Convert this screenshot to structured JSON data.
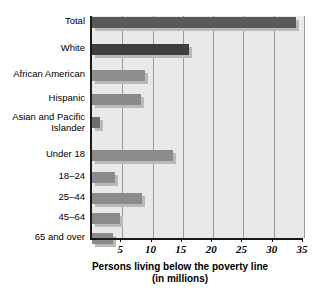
{
  "chart_data": {
    "type": "bar",
    "orientation": "horizontal",
    "title": "",
    "xlabel": "Persons living below the poverty line (in millions)",
    "xlabel_line1": "Persons living below the poverty line",
    "xlabel_line2": "(in millions)",
    "ylabel": "",
    "xlim": [
      0,
      35
    ],
    "ylim": null,
    "grid": true,
    "legend": "none",
    "xticks": [
      5,
      10,
      15,
      20,
      25,
      30,
      35
    ],
    "xtick_labels": [
      "5",
      "10",
      "15",
      "20",
      "25",
      "30",
      "35"
    ],
    "categories": [
      "Total",
      "White",
      "African American",
      "Hispanic",
      "Asian and Pacific Islander",
      "Under 18",
      "18–24",
      "25–44",
      "45–64",
      "65 and over"
    ],
    "values": [
      33.6,
      16.0,
      8.7,
      8.1,
      1.4,
      13.4,
      3.8,
      8.2,
      4.6,
      3.4
    ],
    "bars": [
      {
        "label": "Total",
        "label_line2": "",
        "value": 33.6,
        "color": "#595959",
        "group": "race"
      },
      {
        "label": "White",
        "label_line2": "",
        "value": 16.0,
        "color": "#3f3f3f",
        "group": "race"
      },
      {
        "label": "African American",
        "label_line2": "",
        "value": 8.7,
        "color": "#8e8e8e",
        "group": "race"
      },
      {
        "label": "Hispanic",
        "label_line2": "",
        "value": 8.1,
        "color": "#8a8a8a",
        "group": "race"
      },
      {
        "label": "Asian and Pacific",
        "label_line2": "Islander",
        "value": 1.4,
        "color": "#6e6e6e",
        "group": "race"
      },
      {
        "label": "Under 18",
        "label_line2": "",
        "value": 13.4,
        "color": "#8b8b8b",
        "group": "age"
      },
      {
        "label": "18–24",
        "label_line2": "",
        "value": 3.8,
        "color": "#8b8b8b",
        "group": "age"
      },
      {
        "label": "25–44",
        "label_line2": "",
        "value": 8.2,
        "color": "#8b8b8b",
        "group": "age"
      },
      {
        "label": "45–64",
        "label_line2": "",
        "value": 4.6,
        "color": "#8b8b8b",
        "group": "age"
      },
      {
        "label": "65 and over",
        "label_line2": "",
        "value": 3.4,
        "color": "#8b8b8b",
        "group": "age"
      }
    ],
    "colors": {
      "plot_background": "#e9e9e9",
      "gridline": "#9a9a9a",
      "axis": "#1a1a1a",
      "bar_dark": "#3f3f3f",
      "bar_medium": "#595959",
      "bar_light": "#8b8b8b",
      "bar_shadow": "#b9b9b9",
      "text": "#000000"
    }
  }
}
